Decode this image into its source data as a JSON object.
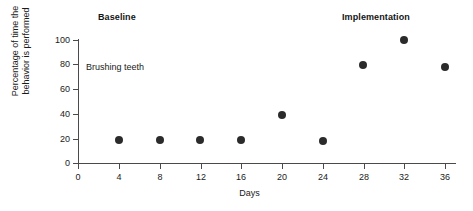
{
  "figure": {
    "phase_labels": [
      {
        "id": "baseline",
        "text": "Baseline"
      },
      {
        "id": "implementation",
        "text": "Implementation"
      }
    ],
    "annotation": "Brushing teeth"
  },
  "chart_data": {
    "type": "scatter",
    "title": "",
    "subtitle": "",
    "xlabel": "Days",
    "ylabel": "Percentage of time the behavior is performed",
    "ylabel_line1": "Percentage of time the",
    "ylabel_line2": "behavior is performed",
    "xlim": [
      0,
      38
    ],
    "ylim": [
      0,
      100
    ],
    "xticks": [
      0,
      4,
      8,
      12,
      16,
      20,
      24,
      28,
      32,
      36
    ],
    "xtick_labels": [
      "0",
      "4",
      "8",
      "12",
      "16",
      "20",
      "24",
      "28",
      "32",
      "36"
    ],
    "yticks": [
      0,
      20,
      40,
      60,
      80,
      100
    ],
    "ytick_labels": [
      "0",
      "20",
      "40",
      "60",
      "80",
      "100"
    ],
    "grid": false,
    "legend": null,
    "marker_color": "#2b2b2b",
    "axis_color": "#4a4a4a",
    "series": [
      {
        "name": "Brushing teeth",
        "x": [
          4,
          8,
          12,
          16,
          20,
          24,
          28,
          32,
          36
        ],
        "values": [
          19,
          19,
          19,
          19,
          39,
          18,
          80,
          100,
          78
        ]
      }
    ],
    "annotations": [
      {
        "text": "Baseline",
        "phase": "baseline",
        "x_range": [
          0,
          26
        ]
      },
      {
        "text": "Implementation",
        "phase": "implementation",
        "x_range": [
          26,
          38
        ]
      },
      {
        "text": "Brushing teeth",
        "x": 6,
        "y": 80
      }
    ]
  }
}
